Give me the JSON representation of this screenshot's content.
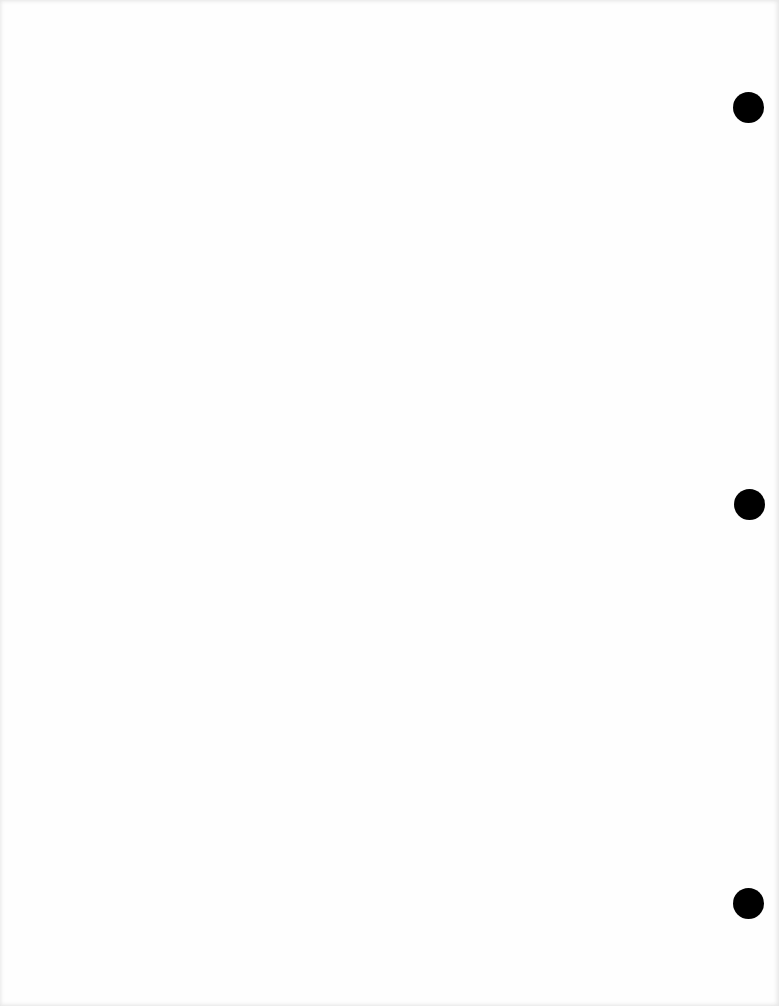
{
  "page": {
    "background": "#fefefe",
    "text": ""
  },
  "punch_holes": [
    {
      "cx": 748,
      "cy": 107,
      "diameter": 31,
      "color": "#000000"
    },
    {
      "cx": 749,
      "cy": 504,
      "diameter": 31,
      "color": "#000000"
    },
    {
      "cx": 748,
      "cy": 903,
      "diameter": 31,
      "color": "#000000"
    }
  ]
}
